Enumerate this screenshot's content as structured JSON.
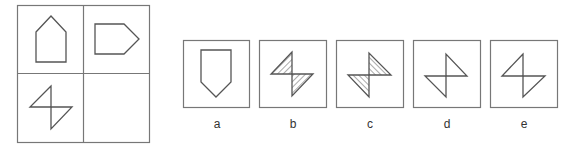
{
  "puzzle": {
    "grid": {
      "cells": [
        {
          "position": "top-left",
          "shape": "pentagon-pointing-up"
        },
        {
          "position": "top-right",
          "shape": "pentagon-pointing-right"
        },
        {
          "position": "bottom-left",
          "shape": "two-triangles-bowtie"
        },
        {
          "position": "bottom-right",
          "shape": "empty"
        }
      ]
    },
    "options": [
      {
        "label": "a",
        "shape": "pentagon-pointing-down"
      },
      {
        "label": "b",
        "shape": "two-triangles-hatched-forward"
      },
      {
        "label": "c",
        "shape": "two-triangles-mirrored-hatched-back"
      },
      {
        "label": "d",
        "shape": "two-triangles-mirrored"
      },
      {
        "label": "e",
        "shape": "two-triangles-outline"
      }
    ]
  },
  "colors": {
    "stroke": "#555555",
    "border": "#777777",
    "background": "#ffffff"
  }
}
